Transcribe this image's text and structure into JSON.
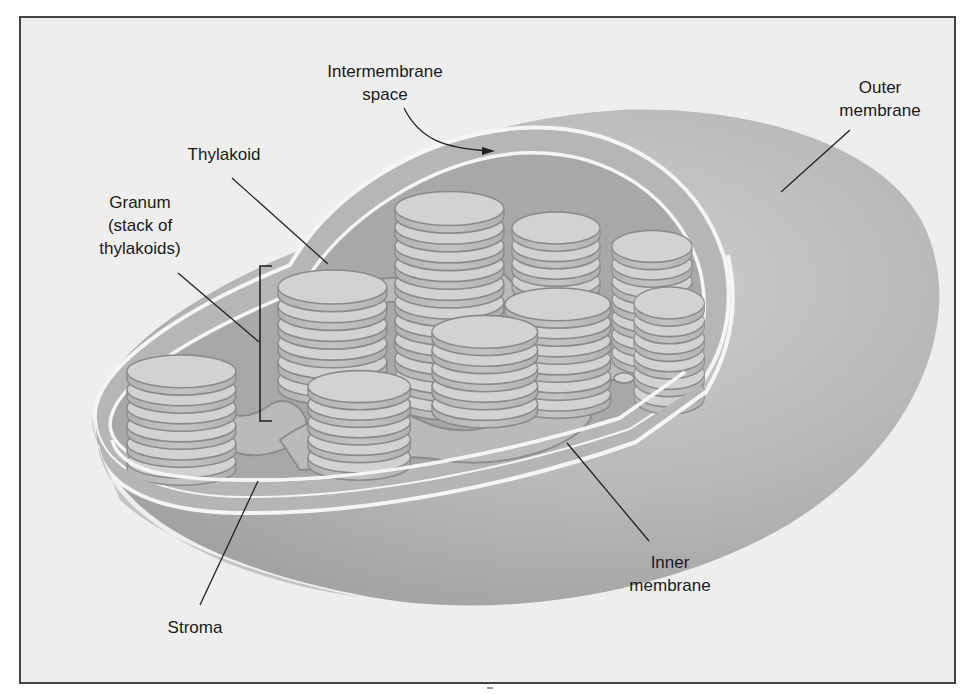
{
  "figure": {
    "colors": {
      "frame_bg": "#eeeeee",
      "frame_border": "#444444",
      "outer_body": "#b4b4b4",
      "outer_body_light": "#c9c9c9",
      "membrane_line": "#f4f4f4",
      "stroma": "#a9a9a9",
      "thylakoid_top": "#d6d6d6",
      "thylakoid_side": "#bdbdbd",
      "thylakoid_edge": "#888888",
      "leader_line": "#222222"
    }
  },
  "labels": {
    "intermembrane_space": {
      "line1": "Intermembrane",
      "line2": "space"
    },
    "outer_membrane": {
      "line1": "Outer",
      "line2": "membrane"
    },
    "thylakoid": {
      "line1": "Thylakoid"
    },
    "granum": {
      "line1": "Granum",
      "line2": "(stack of",
      "line3": "thylakoids)"
    },
    "stroma": {
      "line1": "Stroma"
    },
    "inner_membrane": {
      "line1": "Inner",
      "line2": "membrane"
    }
  }
}
